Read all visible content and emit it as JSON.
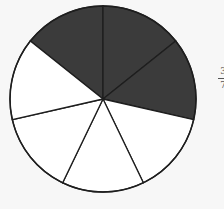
{
  "diagram": {
    "type": "fraction-circle",
    "total_parts": 7,
    "shaded_parts": 3,
    "start_angle_deg": -51.43,
    "shaded_color": "#3b3b3b",
    "unshaded_color": "#ffffff",
    "stroke_color": "#1e1e1e",
    "center": [
      103,
      99
    ],
    "radius": 93
  },
  "fraction_label": {
    "numerator": "3",
    "denominator": "7"
  }
}
